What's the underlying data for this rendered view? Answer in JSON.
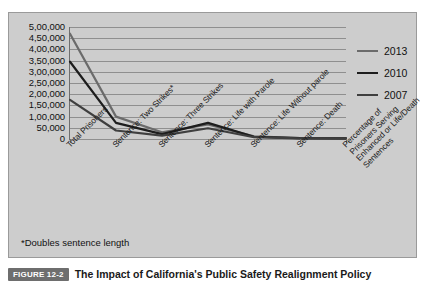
{
  "figure": {
    "badge": "FIGURE 12-2",
    "caption": "The Impact of California's Public Safety Realignment Policy",
    "footnote": "*Doubles sentence length"
  },
  "chart_data": {
    "type": "line",
    "title": "",
    "xlabel": "",
    "ylabel": "",
    "ylim": [
      0,
      500000
    ],
    "grid": true,
    "legend_position": "right",
    "categories": [
      "Total Prisoners",
      "Sentence: Two Strikes*",
      "Sentence: Three Strikes",
      "Sentence: Life with Parole",
      "Sentence: Life Without parole",
      "Sentence: Death",
      "Percentage of Prisoners Serving Enhanced or Life/Death Sentences"
    ],
    "ytick_labels": [
      "5,00,000",
      "4,50,000",
      "4,00,000",
      "3,50,000",
      "3,00,000",
      "2,50,000",
      "2,00,000",
      "1,50,000",
      "1,00,000",
      "50,000",
      "0"
    ],
    "ytick_values": [
      500000,
      450000,
      400000,
      350000,
      300000,
      250000,
      200000,
      150000,
      100000,
      50000,
      0
    ],
    "series": [
      {
        "name": "2013",
        "color": "#6b6b6b",
        "values": [
          470000,
          100000,
          30000,
          65000,
          12000,
          4000,
          3000
        ]
      },
      {
        "name": "2010",
        "color": "#1d1d1d",
        "values": [
          345000,
          72000,
          22000,
          72000,
          10000,
          3500,
          2500
        ]
      },
      {
        "name": "2007",
        "color": "#3f3f3f",
        "values": [
          175000,
          38000,
          15000,
          48000,
          8000,
          3000,
          2000
        ]
      }
    ]
  }
}
